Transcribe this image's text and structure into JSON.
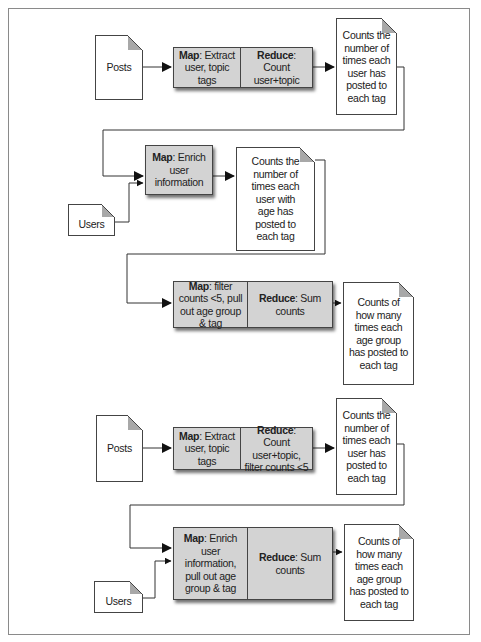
{
  "diagram": {
    "title": "",
    "top_pipeline": {
      "inputs": {
        "posts": "Posts",
        "users": "Users"
      },
      "job1": {
        "map": {
          "keyword": "Map",
          "text": ": Extract user, topic tags"
        },
        "reduce": {
          "keyword": "Reduce",
          "text": ": Count user+topic"
        }
      },
      "output1": "Counts the number of times each user has posted to each tag",
      "job2": {
        "map": {
          "keyword": "Map",
          "text": ": Enrich user information"
        }
      },
      "output2": "Counts the number of times each user with age has posted to each tag",
      "job3": {
        "map": {
          "keyword": "Map",
          "text": ": filter counts <5, pull out age group & tag"
        },
        "reduce": {
          "keyword": "Reduce",
          "text": ": Sum counts"
        }
      },
      "output3": "Counts of how many times each age group has posted to each tag"
    },
    "bottom_pipeline": {
      "inputs": {
        "posts": "Posts",
        "users": "Users"
      },
      "job1": {
        "map": {
          "keyword": "Map",
          "text": ": Extract user, topic tags"
        },
        "reduce": {
          "keyword": "Reduce",
          "text": ": Count user+topic, filter counts <5"
        }
      },
      "output1": "Counts the number of times each user has posted to each tag",
      "job2": {
        "map": {
          "keyword": "Map",
          "text": ": Enrich user information, pull out age group & tag"
        },
        "reduce": {
          "keyword": "Reduce",
          "text": ": Sum counts"
        }
      },
      "output2": "Counts of how many times each age group has posted to each tag"
    },
    "colors": {
      "box_fill": "#d3d3d3",
      "stroke": "#444444",
      "fold": "#a8a8a8",
      "frame": "#8a8a8a"
    }
  }
}
